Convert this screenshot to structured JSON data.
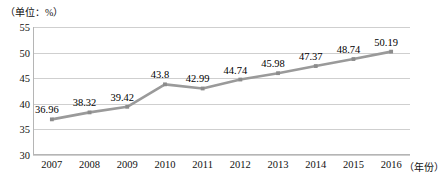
{
  "unit_note": "（单位：%）",
  "axis": {
    "x_unit_label": "（年份）",
    "y_ticks": [
      "55",
      "50",
      "45",
      "40",
      "35",
      "30"
    ],
    "x_ticks": [
      "2007",
      "2008",
      "2009",
      "2010",
      "2011",
      "2012",
      "2013",
      "2014",
      "2015",
      "2016"
    ]
  },
  "colors": {
    "line": "#9a9a9a",
    "marker": "#8c8c8c",
    "gridline": "#cfcfcf",
    "axis": "#b5b5b5",
    "text": "#111111",
    "background": "#ffffff"
  },
  "chart_data": {
    "type": "line",
    "title": "",
    "subtitle": "",
    "xlabel": "（年份）",
    "ylabel": "（单位：%）",
    "categories": [
      "2007",
      "2008",
      "2009",
      "2010",
      "2011",
      "2012",
      "2013",
      "2014",
      "2015",
      "2016"
    ],
    "values": [
      36.96,
      38.32,
      39.42,
      43.8,
      42.99,
      44.74,
      45.98,
      47.37,
      48.74,
      50.19
    ],
    "point_labels": [
      "36.96",
      "38.32",
      "39.42",
      "43.8",
      "42.99",
      "44.74",
      "45.98",
      "47.37",
      "48.74",
      "50.19"
    ],
    "ylim": [
      30,
      55
    ],
    "y_tick_step": 5,
    "grid": true,
    "legend": false,
    "legend_position": "none",
    "series": [
      {
        "name": "",
        "values": [
          36.96,
          38.32,
          39.42,
          43.8,
          42.99,
          44.74,
          45.98,
          47.37,
          48.74,
          50.19
        ]
      }
    ]
  }
}
